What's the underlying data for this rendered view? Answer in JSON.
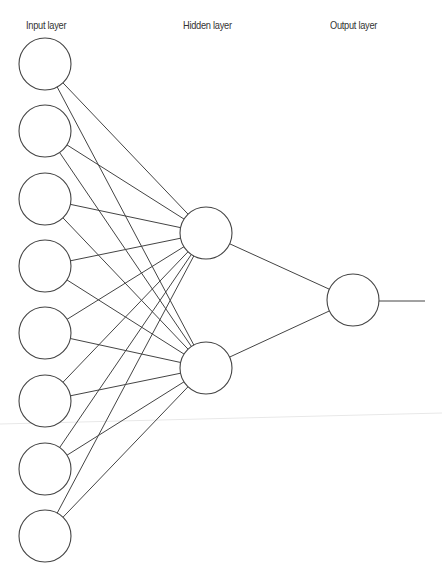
{
  "labels": {
    "input": "Input layer",
    "hidden": "Hidden layer",
    "output": "Output layer"
  },
  "network": {
    "node_radius": 26,
    "colors": {
      "stroke": "#444444",
      "node_fill": "#ffffff",
      "artifact": "#e6e6e6"
    },
    "input_nodes": [
      {
        "x": 45,
        "y": 64
      },
      {
        "x": 45,
        "y": 131
      },
      {
        "x": 45,
        "y": 199
      },
      {
        "x": 45,
        "y": 266
      },
      {
        "x": 45,
        "y": 333
      },
      {
        "x": 45,
        "y": 401
      },
      {
        "x": 45,
        "y": 469
      },
      {
        "x": 45,
        "y": 536
      }
    ],
    "hidden_nodes": [
      {
        "x": 206,
        "y": 233
      },
      {
        "x": 206,
        "y": 368
      }
    ],
    "output_nodes": [
      {
        "x": 353,
        "y": 300
      }
    ],
    "output_line": {
      "x1": 379,
      "y1": 301,
      "x2": 425,
      "y2": 301
    }
  }
}
